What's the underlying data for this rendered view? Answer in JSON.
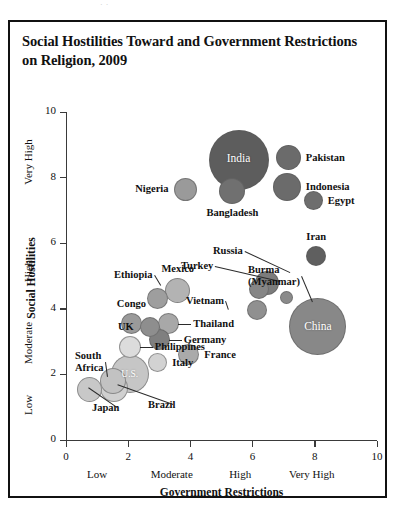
{
  "page": {
    "crop_remnant": "·   ·"
  },
  "chart_data": {
    "type": "scatter",
    "title": "Social Hostilities Toward and Government Restrictions on Religion, 2009",
    "xlabel": "Government Restrictions",
    "ylabel": "Social Hostilities",
    "xlim": [
      0,
      10
    ],
    "ylim": [
      0,
      10
    ],
    "grid": false,
    "legend": "none",
    "x_ticks": [
      "0",
      "2",
      "4",
      "6",
      "8",
      "10"
    ],
    "y_ticks": [
      "0",
      "2",
      "4",
      "6",
      "8",
      "10"
    ],
    "x_categories": [
      "Low",
      "Moderate",
      "High",
      "Very High"
    ],
    "y_categories": [
      "Low",
      "Moderate",
      "High",
      "Very High"
    ],
    "note": "Bubble area represents population size; shading darkness increases with combined index.",
    "points": [
      {
        "name": "India",
        "x": 5.55,
        "y": 8.55,
        "r": 30.0,
        "fill": "#5d5d5d",
        "label_mode": "inside",
        "label_size": 11.5
      },
      {
        "name": "Pakistan",
        "x": 7.15,
        "y": 8.6,
        "r": 12.5,
        "fill": "#6b6b6b",
        "label_mode": "right"
      },
      {
        "name": "Indonesia",
        "x": 7.1,
        "y": 7.7,
        "r": 14.0,
        "fill": "#6b6b6b",
        "label_mode": "right"
      },
      {
        "name": "Egypt",
        "x": 7.95,
        "y": 7.3,
        "r": 9.5,
        "fill": "#6e6e6e",
        "label_mode": "right"
      },
      {
        "name": "Bangladesh",
        "x": 5.35,
        "y": 7.6,
        "r": 13.0,
        "fill": "#707070",
        "label_mode": "below"
      },
      {
        "name": "Nigeria",
        "x": 3.85,
        "y": 7.65,
        "r": 11.5,
        "fill": "#9a9a9a",
        "label_mode": "left"
      },
      {
        "name": "Iran",
        "x": 8.05,
        "y": 5.6,
        "r": 10.0,
        "fill": "#5f5f5f",
        "label_mode": "above"
      },
      {
        "name": "Russia",
        "x": 6.45,
        "y": 4.8,
        "r": 12.0,
        "fill": "#7c7c7c",
        "label_mode": "leader",
        "lx": 243,
        "ly": 251,
        "tx": 290,
        "ty": 272
      },
      {
        "name": "Turkey",
        "x": 6.2,
        "y": 4.6,
        "r": 10.0,
        "fill": "#868686",
        "label_mode": "leader",
        "lx": 213,
        "ly": 266,
        "tx": 280,
        "ty": 281
      },
      {
        "name": "Burma\n(Myanmar)",
        "x": 7.1,
        "y": 4.35,
        "r": 6.5,
        "fill": "#8a8a8a",
        "label_mode": "leader",
        "lx": 300,
        "ly": 276,
        "tx": 313,
        "ty": 302
      },
      {
        "name": "China",
        "x": 8.1,
        "y": 3.45,
        "r": 28.5,
        "fill": "#888888",
        "label_mode": "inside",
        "label_size": 11.5
      },
      {
        "name": "Vietnam",
        "x": 6.15,
        "y": 3.95,
        "r": 10.0,
        "fill": "#909090",
        "label_mode": "leader",
        "lx": 224,
        "ly": 301,
        "tx": 229,
        "ty": 310
      },
      {
        "name": "Mexico",
        "x": 3.6,
        "y": 4.55,
        "r": 12.5,
        "fill": "#b3b3b3",
        "label_mode": "above"
      },
      {
        "name": "Ethiopia",
        "x": 2.95,
        "y": 4.3,
        "r": 10.5,
        "fill": "#9e9e9e",
        "label_mode": "leader",
        "lx": 153,
        "ly": 275,
        "tx": 161,
        "ty": 285
      },
      {
        "name": "Congo",
        "x": 2.1,
        "y": 3.55,
        "r": 10.5,
        "fill": "#9a9a9a",
        "label_mode": "above"
      },
      {
        "name": "Thailand",
        "x": 3.3,
        "y": 3.55,
        "r": 10.5,
        "fill": "#a8a8a8",
        "label_mode": "right-leader"
      },
      {
        "name": "UK",
        "x": 2.7,
        "y": 3.45,
        "r": 10.0,
        "fill": "#8e8e8e",
        "label_mode": "left"
      },
      {
        "name": "Germany",
        "x": 3.0,
        "y": 3.05,
        "r": 10.5,
        "fill": "#7f7f7f",
        "label_mode": "right-leader"
      },
      {
        "name": "Philippines",
        "x": 2.05,
        "y": 2.85,
        "r": 11.0,
        "fill": "#dcdcdc",
        "label_mode": "right-leader"
      },
      {
        "name": "France",
        "x": 3.95,
        "y": 2.6,
        "r": 10.5,
        "fill": "#aaaaaa",
        "label_mode": "right"
      },
      {
        "name": "Italy",
        "x": 2.95,
        "y": 2.35,
        "r": 9.5,
        "fill": "#d2d2d2",
        "label_mode": "right"
      },
      {
        "name": "U.S.",
        "x": 2.05,
        "y": 2.0,
        "r": 19.0,
        "fill": "#c6c6c6",
        "label_mode": "inside",
        "label_size": 9.5
      },
      {
        "name": "South\nAfrica",
        "x": 1.5,
        "y": 1.8,
        "r": 13.0,
        "fill": "#c2c2c2",
        "label_mode": "leader",
        "lx": 104,
        "ly": 362,
        "tx": 108,
        "ty": 377
      },
      {
        "name": "Brazil",
        "x": 1.55,
        "y": 1.6,
        "r": 14.0,
        "fill": "#d0d0d0",
        "label_mode": "leader",
        "lx": 148,
        "ly": 405,
        "tx": 117,
        "ty": 385
      },
      {
        "name": "Japan",
        "x": 0.75,
        "y": 1.55,
        "r": 12.5,
        "fill": "#c8c8c8",
        "label_mode": "leader",
        "lx": 92,
        "ly": 408,
        "tx": 88,
        "ty": 388
      }
    ]
  }
}
